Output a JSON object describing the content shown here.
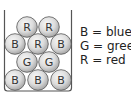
{
  "container": {
    "left_x": 4.5,
    "right_x": 71.5,
    "top_y": 10,
    "bottom_y": 91,
    "stroke": "#555555"
  },
  "ball_style": {
    "radius": 10.3,
    "fill_light": "#f4f4f4",
    "fill_dark": "#b0b0b0",
    "stroke": "#555555",
    "text_color": "#333333"
  },
  "balls": [
    {
      "row": 1,
      "label": "R",
      "cx": 27,
      "cy": 27
    },
    {
      "row": 1,
      "label": "R",
      "cx": 49,
      "cy": 27
    },
    {
      "row": 2,
      "label": "B",
      "cx": 15,
      "cy": 44
    },
    {
      "row": 2,
      "label": "R",
      "cx": 38,
      "cy": 44
    },
    {
      "row": 2,
      "label": "B",
      "cx": 61,
      "cy": 44
    },
    {
      "row": 3,
      "label": "G",
      "cx": 27,
      "cy": 62
    },
    {
      "row": 3,
      "label": "G",
      "cx": 49,
      "cy": 62
    },
    {
      "row": 4,
      "label": "B",
      "cx": 15,
      "cy": 80
    },
    {
      "row": 4,
      "label": "B",
      "cx": 38,
      "cy": 80
    },
    {
      "row": 4,
      "label": "B",
      "cx": 61,
      "cy": 80
    }
  ],
  "legend": {
    "items": [
      {
        "key": "B",
        "text": "B = blue"
      },
      {
        "key": "G",
        "text": "G = green"
      },
      {
        "key": "R",
        "text": "R = red"
      }
    ]
  }
}
